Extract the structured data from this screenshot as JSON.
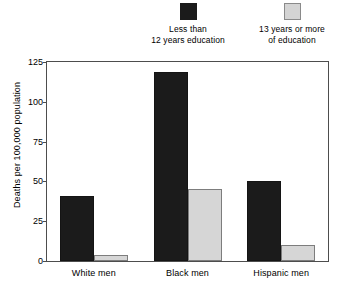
{
  "chart_data": {
    "type": "bar",
    "title": "",
    "subtitle": "",
    "xlabel": "",
    "ylabel": "Deaths per 100,000 population",
    "categories": [
      "White men",
      "Black men",
      "Hispanic men"
    ],
    "series": [
      {
        "name": "Less than\n12 years education",
        "color": "#1b1b1b",
        "values": [
          41,
          119,
          50
        ]
      },
      {
        "name": "13 years or more\nof education",
        "color": "#d6d6d6",
        "values": [
          4,
          45,
          10
        ]
      }
    ],
    "ylim": [
      0,
      125
    ],
    "ytick_labels": [
      "0",
      "25",
      "50",
      "75",
      "100",
      "125"
    ],
    "ytick_values": [
      0,
      25,
      50,
      75,
      100,
      125
    ],
    "grid": false,
    "legend_position": "top"
  },
  "legend": {
    "entries": [
      {
        "label": "Less than\n12 years education",
        "swatch": "dark-swatch"
      },
      {
        "label": "13 years or more\nof education",
        "swatch": "light-swatch"
      }
    ]
  },
  "axes": {
    "y_title": "Deaths per 100,000 population"
  }
}
